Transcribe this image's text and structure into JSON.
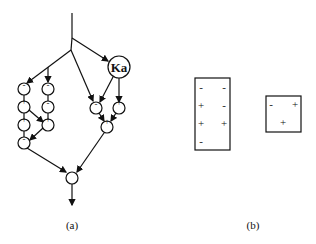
{
  "figure": {
    "panel_a": {
      "caption": "(a)",
      "special_node_label": "Ka",
      "left_column_signs": [
        "-",
        "+",
        "+",
        "-"
      ],
      "second_column_signs": [
        "-",
        "-",
        "+"
      ],
      "right_pair_signs": [
        "-",
        "+"
      ],
      "merge_node_sign": "+"
    },
    "panel_b": {
      "caption": "(b)",
      "tall_box": {
        "rows": [
          [
            "-",
            "-"
          ],
          [
            "+",
            "-"
          ],
          [
            "+",
            "+"
          ],
          [
            "-",
            ""
          ]
        ]
      },
      "small_box": {
        "rows": [
          [
            "-",
            "+"
          ],
          [
            "",
            "+"
          ]
        ]
      }
    }
  }
}
